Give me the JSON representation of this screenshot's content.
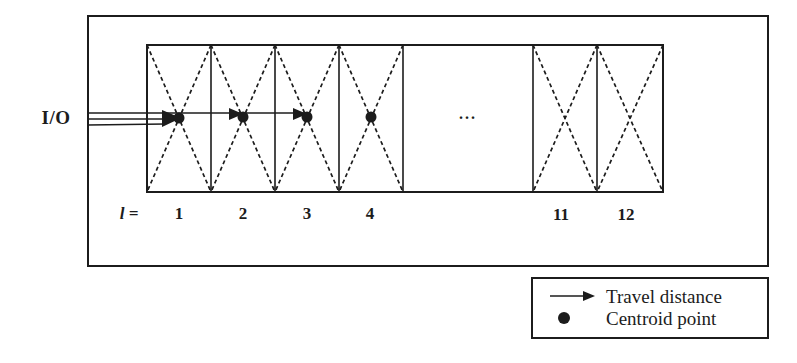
{
  "figure": {
    "io_label": "I/O",
    "level_prefix": "l =",
    "cell_labels": [
      "1",
      "2",
      "3",
      "4",
      "11",
      "12"
    ],
    "ellipsis": "...",
    "legend": {
      "travel_label": "Travel distance",
      "centroid_label": "Centroid point"
    },
    "colors": {
      "ink": "#1c1c1c",
      "paper": "#ffffff"
    }
  }
}
